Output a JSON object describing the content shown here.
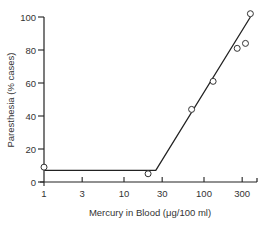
{
  "chart_data": {
    "type": "line",
    "title": "",
    "xlabel": "Mercury in Blood (μg/100 ml)",
    "ylabel": "Paresthesia (% cases)",
    "xscale": "log",
    "xlim": [
      1,
      400
    ],
    "ylim": [
      0,
      100
    ],
    "x_ticks": [
      1,
      3,
      10,
      30,
      100,
      300
    ],
    "x_tick_labels": [
      "1",
      "3",
      "10",
      "30",
      "100",
      "300"
    ],
    "y_ticks": [
      0,
      20,
      40,
      60,
      80,
      100
    ],
    "y_tick_labels": [
      "0",
      "20",
      "40",
      "60",
      "80",
      "100"
    ],
    "grid": false,
    "legend": null,
    "series": [
      {
        "name": "observed",
        "marker": "open-circle",
        "x": [
          1,
          20,
          70,
          130,
          260,
          330,
          380
        ],
        "y": [
          9,
          5,
          44,
          61,
          81,
          84,
          102
        ]
      },
      {
        "name": "fitted",
        "style": "line",
        "x": [
          1,
          25,
          380
        ],
        "y": [
          7,
          7,
          100
        ]
      }
    ]
  }
}
